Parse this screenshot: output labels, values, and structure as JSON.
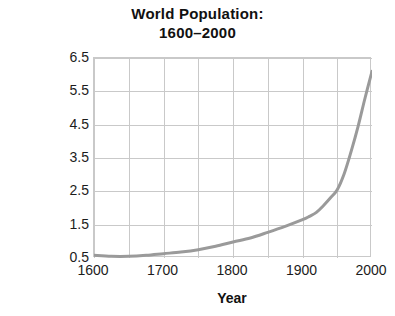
{
  "chart_data": {
    "type": "line",
    "title": "World Population:\n1600–2000",
    "title_lines": [
      "World Population:",
      "1600–2000"
    ],
    "xlabel": "Year",
    "ylabel": "Population (in billions)",
    "xlim": [
      1600,
      2000
    ],
    "ylim": [
      0.5,
      6.5
    ],
    "xticks": [
      1600,
      1700,
      1800,
      1900,
      2000
    ],
    "xtick_labels": [
      "1600",
      "1700",
      "1800",
      "1900",
      "2000"
    ],
    "yticks": [
      0.5,
      1.5,
      2.5,
      3.5,
      4.5,
      5.5,
      6.5
    ],
    "ytick_labels": [
      "0.5",
      "1.5",
      "2.5",
      "3.5",
      "4.5",
      "5.5",
      "6.5"
    ],
    "grid": true,
    "grid_x_step": 50,
    "grid_y_step": 1.0,
    "legend": null,
    "line_color": "#9a9a9a",
    "line_width": 3,
    "frame_color": "#c9c9c9",
    "background": "#ffffff",
    "series": [
      {
        "name": "World population",
        "x": [
          1600,
          1625,
          1650,
          1675,
          1700,
          1725,
          1750,
          1775,
          1800,
          1825,
          1850,
          1875,
          1900,
          1910,
          1920,
          1930,
          1940,
          1950,
          1960,
          1970,
          1980,
          1990,
          2000
        ],
        "values": [
          0.58,
          0.55,
          0.55,
          0.58,
          0.63,
          0.68,
          0.75,
          0.85,
          0.98,
          1.1,
          1.27,
          1.45,
          1.65,
          1.75,
          1.87,
          2.07,
          2.3,
          2.55,
          3.03,
          3.7,
          4.45,
          5.3,
          6.1
        ]
      }
    ],
    "annotations": []
  }
}
